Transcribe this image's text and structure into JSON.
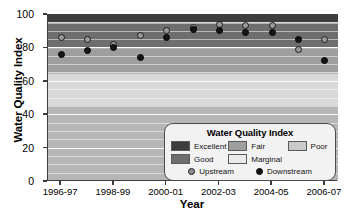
{
  "chart_data": {
    "type": "scatter",
    "title": "",
    "xlabel": "Year",
    "ylabel": "Water Quality Index",
    "ylim": [
      0,
      100
    ],
    "yticks": [
      0,
      20,
      40,
      60,
      80,
      100
    ],
    "grid": true,
    "legend_position": "lower-right",
    "x": [
      "1996-97",
      "1997-98",
      "1998-99",
      "1999-00",
      "2000-01",
      "2001-02",
      "2002-03",
      "2003-04",
      "2004-05",
      "2005-06",
      "2006-07"
    ],
    "xtick_labels": [
      "1996-97",
      "1998-99",
      "2000-01",
      "2002-03",
      "2004-05",
      "2006-07"
    ],
    "series": [
      {
        "name": "Upstream",
        "marker": "open-circle",
        "color": "#9a9a9a",
        "values": [
          86,
          85,
          82,
          87,
          90,
          92,
          94,
          93,
          93,
          79,
          85
        ]
      },
      {
        "name": "Downstream",
        "marker": "filled-circle",
        "color": "#141414",
        "values": [
          76,
          78,
          80,
          74,
          86,
          91,
          90,
          89,
          89,
          85,
          72
        ]
      }
    ],
    "bands": [
      {
        "name": "Excellent",
        "from": 95,
        "to": 100,
        "color": "#3d3d3d"
      },
      {
        "name": "Good",
        "from": 80,
        "to": 94,
        "color": "#6e6e6e"
      },
      {
        "name": "Fair",
        "from": 65,
        "to": 79,
        "color": "#9e9e9e"
      },
      {
        "name": "Marginal",
        "from": 45,
        "to": 64,
        "color": "#d8d8d8"
      },
      {
        "name": "Poor",
        "from": 0,
        "to": 44,
        "color": "#b6b6b6"
      }
    ]
  },
  "legend": {
    "title": "Water Quality Index",
    "bands": [
      {
        "label": "Excellent",
        "color": "#3d3d3d"
      },
      {
        "label": "Good",
        "color": "#6e6e6e"
      },
      {
        "label": "Fair",
        "color": "#9e9e9e"
      },
      {
        "label": "Marginal",
        "color": "#eaeaea"
      },
      {
        "label": "Poor",
        "color": "#c9c9c9"
      }
    ],
    "series": [
      {
        "label": "Upstream",
        "marker": "upstream-marker"
      },
      {
        "label": "Downstream",
        "marker": "downstream-marker"
      }
    ]
  }
}
